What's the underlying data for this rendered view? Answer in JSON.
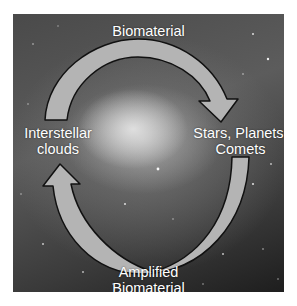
{
  "diagram": {
    "nodes": [
      {
        "id": "top",
        "label": "Biomaterial"
      },
      {
        "id": "right",
        "label_line1": "Stars, Planets.",
        "label_line2": "Comets"
      },
      {
        "id": "bottom",
        "label_line1": "Amplified",
        "label_line2": "Biomaterial"
      },
      {
        "id": "left",
        "label_line1": "Interstellar",
        "label_line2": "clouds"
      }
    ],
    "edges": [
      {
        "from": "left",
        "to": "right",
        "via": "top",
        "direction": "clockwise"
      },
      {
        "from": "right",
        "to": "left",
        "via": "bottom",
        "direction": "clockwise"
      }
    ],
    "colors": {
      "arrow_fill": "#b4b4b4",
      "arrow_stroke": "#111111",
      "label": "#ffffff",
      "background": "#4a4a4a"
    }
  }
}
